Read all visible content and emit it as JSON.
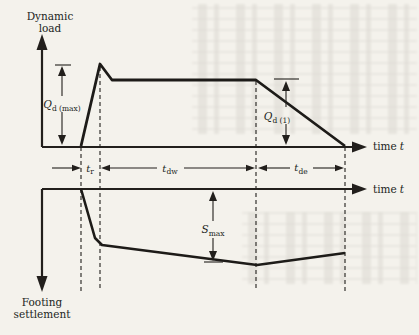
{
  "figure": {
    "type": "engineering-diagram",
    "ink_color": "#221f1c",
    "paper_color": "#f4f2ec"
  },
  "top_chart": {
    "y_axis_label_line1": "Dynamic",
    "y_axis_label_line2": "load",
    "x_axis_label_word": "time",
    "x_axis_label_var": "t",
    "peak_label": {
      "main": "Q",
      "sub": "d (max)"
    },
    "plateau_label": {
      "main": "Q",
      "sub": "d (1)"
    },
    "curve_points": "81,146 100,64 112,80 256,80 345,146"
  },
  "time_intervals": {
    "rise": {
      "main": "t",
      "sub": "r"
    },
    "dwell": {
      "main": "t",
      "sub": "dw"
    },
    "decay": {
      "main": "t",
      "sub": "de"
    }
  },
  "bottom_chart": {
    "y_axis_label_line1": "Footing",
    "y_axis_label_line2": "settlement",
    "x_axis_label_word": "time",
    "x_axis_label_var": "t",
    "settlement_label": {
      "main": "S",
      "sub": "max"
    },
    "curve_points": "81,189 95,238 102,245 257,265 345,253"
  }
}
